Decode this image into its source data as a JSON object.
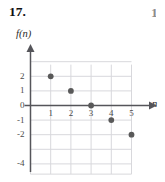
{
  "problem": {
    "number": "17.",
    "next_number_partial": "1"
  },
  "axes": {
    "y_label": "f(n)",
    "x_label": "n"
  },
  "chart_data": {
    "type": "scatter",
    "title": "",
    "xlabel": "n",
    "ylabel": "f(n)",
    "x": [
      1,
      2,
      3,
      4,
      5
    ],
    "values": [
      2,
      1,
      0,
      -1,
      -2
    ],
    "series": [
      {
        "name": "f(n)",
        "points": [
          {
            "x": 1,
            "y": 2
          },
          {
            "x": 2,
            "y": 1
          },
          {
            "x": 3,
            "y": 0
          },
          {
            "x": 4,
            "y": -1
          },
          {
            "x": 5,
            "y": -2
          }
        ]
      }
    ],
    "xlim": [
      0,
      6
    ],
    "ylim": [
      -4.6,
      3.0
    ],
    "x_ticks": [
      1,
      2,
      3,
      4,
      5
    ],
    "x_tick_labels": [
      "1",
      "2",
      "3",
      "4",
      "5"
    ],
    "y_ticks": [
      2,
      1,
      0,
      -1,
      -2,
      -4
    ],
    "y_tick_labels": [
      "2",
      "1",
      "0",
      "-1",
      "-2",
      "-4"
    ],
    "grid": true,
    "legend": "none",
    "point_color": "#595959",
    "grid_color": "#d8d8dc",
    "axis_color": "#55555a"
  },
  "colors": {
    "background": "#ffffff",
    "point": "#595959",
    "grid": "#d8d8dc",
    "axis": "#55555a",
    "text": "#1a1a1a"
  }
}
